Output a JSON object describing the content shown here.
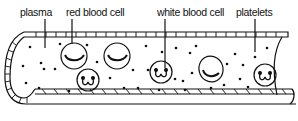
{
  "diagram": {
    "labels": {
      "plasma": "plasma",
      "red_blood_cell": "red blood cell",
      "white_blood_cell": "white blood cell",
      "platelets": "platelets"
    },
    "colors": {
      "ink": "#111111",
      "background": "#ffffff"
    },
    "red_blood_cells": [
      {
        "cx": 77,
        "cy": 55
      },
      {
        "cx": 119,
        "cy": 55
      },
      {
        "cx": 235,
        "cy": 70
      }
    ],
    "white_blood_cells": [
      {
        "cx": 88,
        "cy": 80
      },
      {
        "cx": 160,
        "cy": 75
      },
      {
        "cx": 267,
        "cy": 80
      }
    ]
  }
}
